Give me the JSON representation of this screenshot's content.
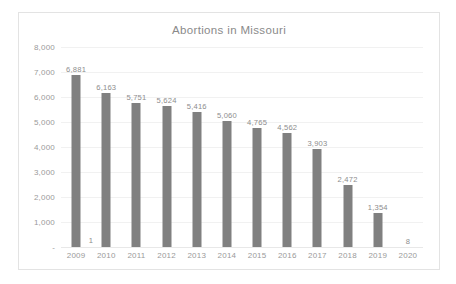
{
  "chart_data": {
    "type": "bar",
    "title": "Abortions in Missouri",
    "xlabel": "",
    "ylabel": "",
    "categories": [
      "2009",
      "2010",
      "2011",
      "2012",
      "2013",
      "2014",
      "2015",
      "2016",
      "2017",
      "2018",
      "2019",
      "2020"
    ],
    "values": [
      6881,
      6163,
      5751,
      5624,
      5416,
      5060,
      4765,
      4562,
      3903,
      2472,
      1354,
      8
    ],
    "data_labels": [
      "6,881",
      "6,163",
      "5,751",
      "5,624",
      "5,416",
      "5,060",
      "4,765",
      "4,562",
      "3,903",
      "2,472",
      "1,354",
      "8"
    ],
    "ylim": [
      0,
      8000
    ],
    "y_ticks": [
      0,
      1000,
      2000,
      3000,
      4000,
      5000,
      6000,
      7000,
      8000
    ],
    "y_tick_labels": [
      "-",
      "1,000",
      "2,000",
      "3,000",
      "4,000",
      "5,000",
      "6,000",
      "7,000",
      "8,000"
    ],
    "grid": true,
    "legend": "none",
    "series_color": "#808080",
    "extra_annotation": {
      "text": "1",
      "near_category": "2009",
      "position": "baseline"
    }
  },
  "figure": {
    "background_color": "#ffffff",
    "border_color": "#e3e3e3",
    "title_color": "#8a8a8a",
    "axis_text_color": "#9a9a9a",
    "label_text_color": "#8d8d8d",
    "gridline_color": "#f1f1f1"
  }
}
